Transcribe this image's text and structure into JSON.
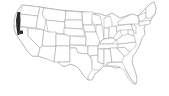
{
  "map": {
    "type": "range-map",
    "region": "United States (contiguous)",
    "background": "#ffffff",
    "state_border_color": "#9a9a9a",
    "highlight_color": "#2b2b2b",
    "highlighted_areas": [
      {
        "name": "northern-california-coast",
        "state": "California"
      },
      {
        "name": "central-california-patch",
        "state": "California"
      }
    ]
  }
}
